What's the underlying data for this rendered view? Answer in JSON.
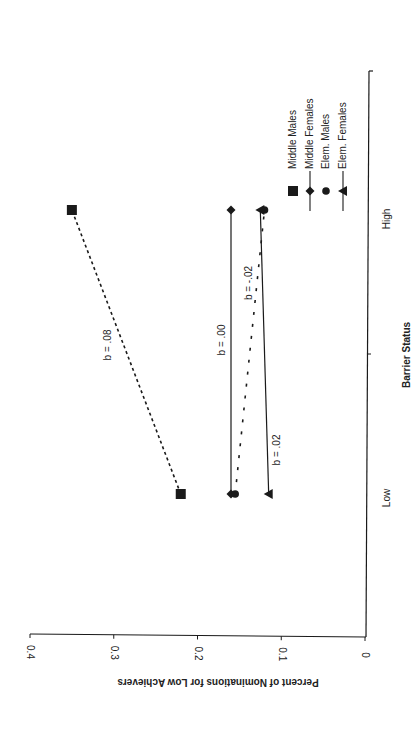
{
  "chart_data": {
    "type": "line",
    "orientation_note": "figure rotated 90 degrees counter-clockwise on page",
    "title": "",
    "xlabel": "Barrier Status",
    "ylabel": "Percent of Nominations for Low Achievers",
    "categories": [
      "Low",
      "High"
    ],
    "ylim": [
      0,
      0.4
    ],
    "yticks": [
      "0",
      "0.1",
      "0.2",
      "0.3",
      "0.4"
    ],
    "grid": false,
    "legend_position": "right (upper-right in rotated frame)",
    "series": [
      {
        "name": "Middle Males",
        "marker": "square",
        "line": "dashed",
        "values": [
          0.22,
          0.35
        ],
        "slope_label": "b = .08"
      },
      {
        "name": "Middle Females",
        "marker": "diamond",
        "line": "solid",
        "values": [
          0.16,
          0.16
        ],
        "slope_label": "b = .00"
      },
      {
        "name": "Elem. Males",
        "marker": "circle",
        "line": "dashed",
        "values": [
          0.155,
          0.12
        ],
        "slope_label": "b = -.02"
      },
      {
        "name": "Elem. Females",
        "marker": "triangle",
        "line": "solid",
        "values": [
          0.115,
          0.125
        ],
        "slope_label": "b = .02"
      }
    ]
  },
  "legend": {
    "items": [
      {
        "label": "Middle Males",
        "marker": "square",
        "line": false
      },
      {
        "label": "Middle Females",
        "marker": "diamond",
        "line": true
      },
      {
        "label": "Elem. Males",
        "marker": "circle",
        "line": false
      },
      {
        "label": "Elem. Females",
        "marker": "triangle",
        "line": true
      }
    ]
  },
  "colors": {
    "ink": "#1a1a1a",
    "background": "#ffffff"
  }
}
